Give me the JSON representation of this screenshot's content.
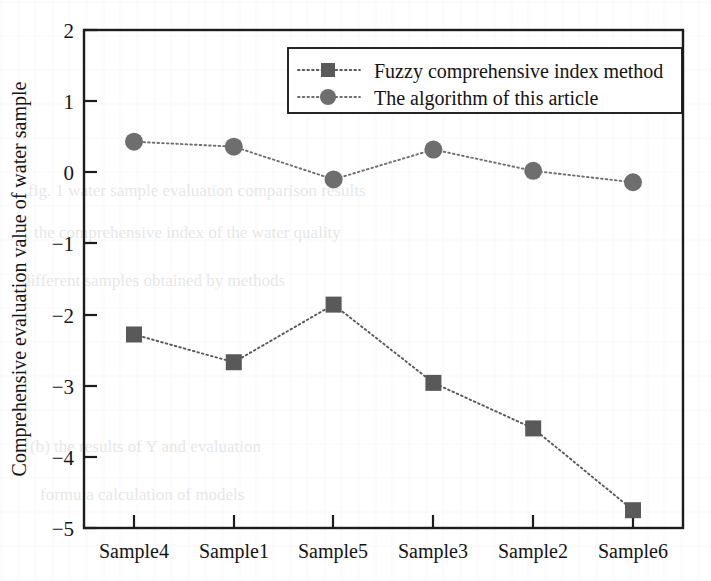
{
  "chart_data": {
    "type": "line",
    "title": "",
    "subtitle": "",
    "xlabel": "",
    "ylabel": "Comprehensive evaluation value of water sample",
    "categories": [
      "Sample4",
      "Sample1",
      "Sample5",
      "Sample3",
      "Sample2",
      "Sample6"
    ],
    "ylim": [
      -5,
      2
    ],
    "yticks": [
      2,
      1,
      0,
      -1,
      -2,
      -3,
      -4,
      -5
    ],
    "ytick_labels": [
      "2",
      "1",
      "0",
      "−1",
      "−2",
      "−3",
      "−4",
      "−5"
    ],
    "grid": false,
    "legend_position": "top-right",
    "series": [
      {
        "name": "Fuzzy comprehensive index method",
        "marker": "square",
        "color": "#595959",
        "line_style": "dotted",
        "values": [
          -2.28,
          -2.67,
          -1.86,
          -2.96,
          -3.6,
          -4.75
        ]
      },
      {
        "name": "The algorithm of this article",
        "marker": "circle",
        "color": "#6e6e6e",
        "line_style": "dotted",
        "values": [
          0.43,
          0.36,
          -0.1,
          0.32,
          0.02,
          -0.14
        ]
      }
    ]
  },
  "legend": {
    "entries": [
      {
        "label": "Fuzzy comprehensive index method",
        "marker": "square-marker-icon"
      },
      {
        "label": "The algorithm of this article",
        "marker": "circle-marker-icon"
      }
    ]
  },
  "axes": {
    "y_title": "Comprehensive evaluation value of water sample",
    "y_tick_labels": [
      "2",
      "1",
      "0",
      "−1",
      "−2",
      "−3",
      "−4",
      "−5"
    ],
    "x_tick_labels": [
      "Sample4",
      "Sample1",
      "Sample5",
      "Sample3",
      "Sample2",
      "Sample6"
    ]
  },
  "colors": {
    "square_series": "#595959",
    "circle_series": "#6e6e6e",
    "axis": "#1c1c1c",
    "background": "#ffffff"
  },
  "ghost": {
    "row1": "fig. 1 water  sample  evaluation  comparison  results",
    "row2": "the  comprehensive  index  of  the  water  quality",
    "row3": "different  samples  obtained  by  methods",
    "row4": "(b)   the  results  of  Y    and   evaluation",
    "row5": "formula  calculation  of  models"
  }
}
